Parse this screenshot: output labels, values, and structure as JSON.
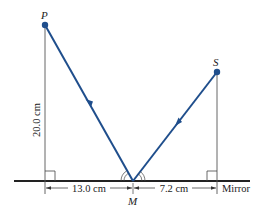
{
  "diagram": {
    "points": {
      "P": {
        "label": "P",
        "x": 45,
        "y": 25
      },
      "S": {
        "label": "S",
        "x": 217,
        "y": 72
      },
      "M": {
        "label": "M",
        "x": 133,
        "y": 181
      }
    },
    "labels": {
      "height": "20.0 cm",
      "left_distance": "13.0 cm",
      "right_distance": "7.2 cm",
      "mirror": "Mirror"
    },
    "colors": {
      "ray": "#1f4e8c",
      "point": "#1f4e8c",
      "mirror": "#222222",
      "guide": "#555555",
      "text": "#222222"
    }
  }
}
